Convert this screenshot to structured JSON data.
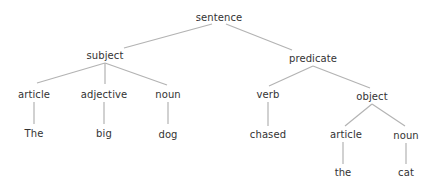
{
  "diagram": {
    "type": "parse-tree",
    "colors": {
      "edge": "#b3b3b3",
      "text": "#333333",
      "background": "#ffffff"
    },
    "nodes": {
      "sentence": {
        "label": "sentence"
      },
      "subject": {
        "label": "subject"
      },
      "predicate": {
        "label": "predicate"
      },
      "subj_article": {
        "label": "article"
      },
      "subj_adjective": {
        "label": "adjective"
      },
      "subj_noun": {
        "label": "noun"
      },
      "word_the_cap": {
        "label": "The"
      },
      "word_big": {
        "label": "big"
      },
      "word_dog": {
        "label": "dog"
      },
      "verb": {
        "label": "verb"
      },
      "object": {
        "label": "object"
      },
      "word_chased": {
        "label": "chased"
      },
      "obj_article": {
        "label": "article"
      },
      "obj_noun": {
        "label": "noun"
      },
      "word_the": {
        "label": "the"
      },
      "word_cat": {
        "label": "cat"
      }
    },
    "edges": [
      [
        "sentence",
        "subject"
      ],
      [
        "sentence",
        "predicate"
      ],
      [
        "subject",
        "subj_article"
      ],
      [
        "subject",
        "subj_adjective"
      ],
      [
        "subject",
        "subj_noun"
      ],
      [
        "subj_article",
        "word_the_cap"
      ],
      [
        "subj_adjective",
        "word_big"
      ],
      [
        "subj_noun",
        "word_dog"
      ],
      [
        "predicate",
        "verb"
      ],
      [
        "predicate",
        "object"
      ],
      [
        "verb",
        "word_chased"
      ],
      [
        "object",
        "obj_article"
      ],
      [
        "object",
        "obj_noun"
      ],
      [
        "obj_article",
        "word_the"
      ],
      [
        "obj_noun",
        "word_cat"
      ]
    ]
  }
}
